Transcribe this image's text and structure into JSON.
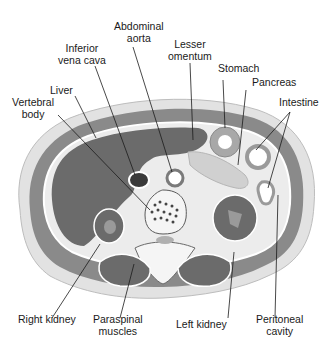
{
  "diagram": {
    "type": "anatomical cross-section",
    "colors": {
      "background": "#ffffff",
      "skin": "#e2e2e2",
      "muscle_wall": "#8a8a8a",
      "organ_dark": "#6b6b6b",
      "cavity_light": "#e8e8e8",
      "line": "#1a1a1a"
    },
    "labels": {
      "abdominal_aorta": [
        "Abdominal",
        "aorta"
      ],
      "inferior_vena_cava": [
        "Inferior",
        "vena cava"
      ],
      "lesser_omentum": [
        "Lesser",
        "omentum"
      ],
      "stomach": "Stomach",
      "pancreas": "Pancreas",
      "liver": "Liver",
      "intestine": "Intestine",
      "vertebral_body": [
        "Vertebral",
        "body"
      ],
      "right_kidney": "Right kidney",
      "paraspinal_muscles": [
        "Paraspinal",
        "muscles"
      ],
      "left_kidney": "Left kidney",
      "peritoneal_cavity": [
        "Peritoneal",
        "cavity"
      ]
    }
  }
}
